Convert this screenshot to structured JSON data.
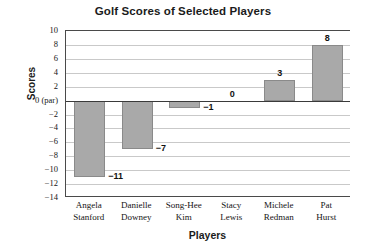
{
  "chart_data": {
    "type": "bar",
    "title": "Golf Scores of Selected Players",
    "xlabel": "Players",
    "ylabel": "Scores",
    "categories": [
      "Angela Stanford",
      "Danielle Downey",
      "Song-Hee Kim",
      "Stacy Lewis",
      "Michele Redman",
      "Pat Hurst"
    ],
    "category_lines": [
      [
        "Angela",
        "Stanford"
      ],
      [
        "Danielle",
        "Downey"
      ],
      [
        "Song-Hee",
        "Kim"
      ],
      [
        "Stacy",
        "Lewis"
      ],
      [
        "Michele",
        "Redman"
      ],
      [
        "Pat",
        "Hurst"
      ]
    ],
    "values": [
      -11,
      -7,
      -1,
      0,
      3,
      8
    ],
    "data_labels": [
      "−11",
      "−7",
      "−1",
      "0",
      "3",
      "8"
    ],
    "ylim": [
      -14,
      10
    ],
    "ytick_values": [
      10,
      8,
      6,
      4,
      2,
      0,
      -2,
      -4,
      -6,
      -8,
      -10,
      -12,
      -14
    ],
    "ytick_labels": [
      "10",
      "8",
      "6",
      "4",
      "2",
      "0 (par)",
      "−2",
      "−4",
      "−6",
      "−8",
      "−10",
      "−12",
      "−14"
    ],
    "grid": true,
    "legend": null,
    "colors": {
      "bar_fill": "#a9a9a9",
      "bar_stroke": "#8a8a8a",
      "gridline": "#c9c9c9",
      "axis": "#4a4a4a",
      "zero_line": "#3a3a3a",
      "text": "#1b1b1b",
      "background": "#ffffff"
    }
  }
}
